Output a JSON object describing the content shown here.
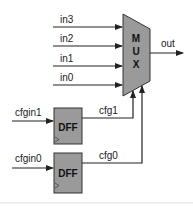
{
  "diagram": {
    "mux": {
      "label_letters": [
        "M",
        "U",
        "X"
      ],
      "inputs": [
        "in3",
        "in2",
        "in1",
        "in0"
      ],
      "output": "out"
    },
    "flipflops": [
      {
        "label": "DFF",
        "input": "cfgin1",
        "output": "cfg1"
      },
      {
        "label": "DFF",
        "input": "cfgin0",
        "output": "cfg0"
      }
    ],
    "colors": {
      "block_fill": "#9a9a9a",
      "stroke": "#222222"
    }
  }
}
